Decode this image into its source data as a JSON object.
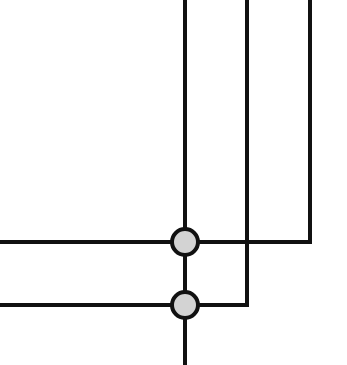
{
  "diagram": {
    "type": "wire-junction-diagram",
    "colors": {
      "background": "#ffffff",
      "line": "#111111",
      "node_fill": "#d3d3d3",
      "node_stroke": "#111111"
    },
    "stroke_width": 4,
    "wires": [
      {
        "id": "main-vertical",
        "points": [
          [
            185,
            0
          ],
          [
            185,
            365
          ]
        ]
      },
      {
        "id": "middle-vertical",
        "points": [
          [
            247,
            0
          ],
          [
            247,
            305
          ],
          [
            0,
            305
          ]
        ]
      },
      {
        "id": "right-vertical",
        "points": [
          [
            310,
            0
          ],
          [
            310,
            242
          ],
          [
            0,
            242
          ]
        ]
      }
    ],
    "nodes": [
      {
        "id": "junction-upper",
        "cx": 185,
        "cy": 242,
        "r": 13
      },
      {
        "id": "junction-lower",
        "cx": 185,
        "cy": 305,
        "r": 13
      }
    ]
  }
}
